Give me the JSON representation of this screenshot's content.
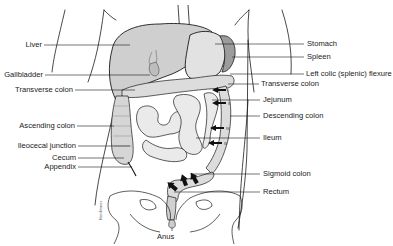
{
  "figure": {
    "type": "anatomical-diagram",
    "colors": {
      "line": "#1a1a1a",
      "organ_fill": "#d8d8d8",
      "organ_dark": "#a8a8a8",
      "background": "#ffffff"
    }
  },
  "labels_left": [
    {
      "id": "liver",
      "text": "Liver"
    },
    {
      "id": "gallbladder",
      "text": "Gallbladder"
    },
    {
      "id": "transverse-colon-left",
      "text": "Transverse colon"
    },
    {
      "id": "ascending-colon",
      "text": "Ascending colon"
    },
    {
      "id": "ileocecal-junction",
      "text": "Ileocecal junction"
    },
    {
      "id": "cecum",
      "text": "Cecum"
    },
    {
      "id": "appendix",
      "text": "Appendix"
    }
  ],
  "labels_right": [
    {
      "id": "stomach",
      "text": "Stomach"
    },
    {
      "id": "spleen",
      "text": "Spleen"
    },
    {
      "id": "left-colic-flexure",
      "text": "Left colic (splenic) flexure"
    },
    {
      "id": "transverse-colon-right",
      "text": "Transverse colon"
    },
    {
      "id": "jejunum",
      "text": "Jejunum"
    },
    {
      "id": "descending-colon",
      "text": "Descending colon"
    },
    {
      "id": "ileum",
      "text": "Ileum"
    },
    {
      "id": "sigmoid-colon",
      "text": "Sigmoid colon"
    },
    {
      "id": "rectum",
      "text": "Rectum"
    }
  ],
  "labels_bottom": [
    {
      "id": "anus",
      "text": "Anus"
    }
  ],
  "movement_arrows": {
    "descending": [
      "I",
      "II",
      "III",
      "IV"
    ],
    "sigmoid_count": 3
  },
  "signature": "Nordmann"
}
